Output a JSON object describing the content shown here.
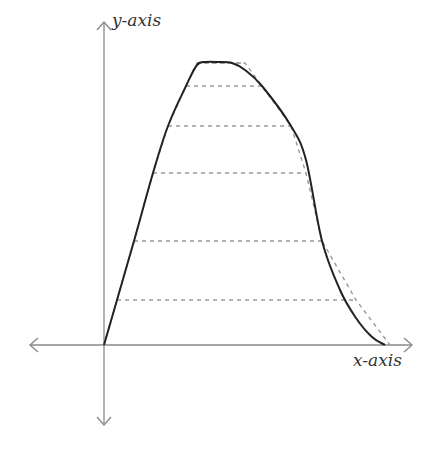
{
  "diagram": {
    "labels": {
      "y_axis": "y-axis",
      "x_axis": "x-axis"
    },
    "colors": {
      "axis": "#8a8a8a",
      "curve": "#222222",
      "dashed": "#9a9a9a",
      "text": "#333333"
    },
    "origin": [
      104,
      345
    ],
    "x_axis": {
      "from": 30,
      "to": 412
    },
    "y_axis": {
      "from": 22,
      "to": 425
    },
    "curve_points": [
      [
        104,
        345
      ],
      [
        117,
        300
      ],
      [
        134,
        241
      ],
      [
        153,
        173
      ],
      [
        168,
        126
      ],
      [
        186,
        86
      ],
      [
        197,
        65
      ],
      [
        206,
        62
      ],
      [
        218,
        62
      ],
      [
        232,
        63
      ],
      [
        245,
        70
      ],
      [
        262,
        86
      ],
      [
        291,
        126
      ],
      [
        306,
        160
      ],
      [
        322,
        241
      ],
      [
        340,
        290
      ],
      [
        356,
        318
      ],
      [
        372,
        337
      ],
      [
        385,
        345
      ]
    ],
    "dashed_polyline": [
      [
        104,
        345
      ],
      [
        117,
        300
      ],
      [
        134,
        241
      ],
      [
        153,
        173
      ],
      [
        168,
        126
      ],
      [
        186,
        86
      ],
      [
        197,
        63
      ],
      [
        245,
        63
      ],
      [
        262,
        86
      ],
      [
        291,
        126
      ],
      [
        306,
        173
      ],
      [
        322,
        241
      ],
      [
        356,
        300
      ],
      [
        390,
        345
      ]
    ],
    "horizontal_slices": [
      {
        "y": 300,
        "x1": 117,
        "x2": 356
      },
      {
        "y": 241,
        "x1": 134,
        "x2": 322
      },
      {
        "y": 173,
        "x1": 153,
        "x2": 306
      },
      {
        "y": 126,
        "x1": 168,
        "x2": 291
      },
      {
        "y": 86,
        "x1": 186,
        "x2": 262
      },
      {
        "y": 63,
        "x1": 197,
        "x2": 245
      }
    ]
  }
}
